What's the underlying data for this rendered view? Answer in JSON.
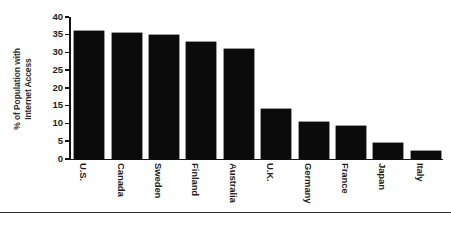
{
  "chart_data": {
    "type": "bar",
    "title": "",
    "xlabel": "",
    "ylabel_line1": "% of Population with",
    "ylabel_line2": "Internet Access",
    "ylabel": "% of Population with Internet Access",
    "categories": [
      "U.S.",
      "Canada",
      "Sweden",
      "Finland",
      "Australia",
      "U.K.",
      "Germany",
      "France",
      "Japan",
      "Italy"
    ],
    "values": [
      36,
      35.5,
      35,
      33,
      31,
      14,
      10.3,
      9.3,
      4.5,
      2.3
    ],
    "ylim": [
      0,
      40
    ],
    "ytick_values": [
      0,
      5,
      10,
      15,
      20,
      25,
      30,
      35,
      40
    ],
    "ytick_labels": [
      "0",
      "5",
      "10",
      "15",
      "20",
      "25",
      "30",
      "35",
      "40"
    ],
    "grid": false,
    "legend": false,
    "legend_position": "none",
    "bar_color": "#0b0b0b",
    "axis_color": "#151515",
    "background_color": "#ffffff"
  }
}
